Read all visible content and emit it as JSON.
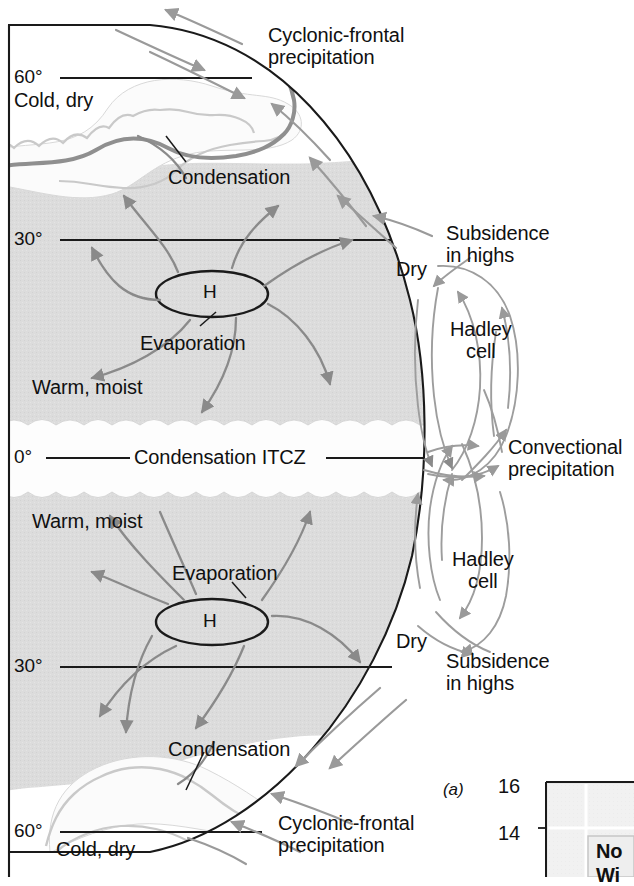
{
  "figure": {
    "kind": "atmospheric-circulation-cross-section"
  },
  "colors": {
    "land_fill": "#dcdcdc",
    "cloud_fill": "#fbfbfb",
    "outline": "#1a1a1a",
    "arrow": "#8a8a8a",
    "front_line": "#8f8f8f",
    "text": "#101010",
    "panel_grid": "#d6d6d6"
  },
  "latitude_labels": [
    {
      "id": "lat-60n",
      "text": "60°",
      "x": 14,
      "y": 66
    },
    {
      "id": "lat-30n",
      "text": "30°",
      "x": 14,
      "y": 228
    },
    {
      "id": "lat-0",
      "text": "0°",
      "x": 14,
      "y": 448
    },
    {
      "id": "lat-30s",
      "text": "30°",
      "x": 14,
      "y": 655
    },
    {
      "id": "lat-60s",
      "text": "60°",
      "x": 14,
      "y": 820
    }
  ],
  "annotations": [
    {
      "id": "cold-dry-north",
      "text": "Cold, dry",
      "x": 14,
      "y": 89,
      "size": "body"
    },
    {
      "id": "cyclonic-north",
      "text": "Cyclonic-frontal\nprecipitation",
      "x": 268,
      "y": 24,
      "size": "body"
    },
    {
      "id": "condensation-north",
      "text": "Condensation",
      "x": 168,
      "y": 166,
      "size": "body"
    },
    {
      "id": "subsidence-north",
      "text": "Subsidence\nin highs",
      "x": 446,
      "y": 222,
      "size": "body"
    },
    {
      "id": "dry-north",
      "text": "Dry",
      "x": 396,
      "y": 258,
      "size": "body"
    },
    {
      "id": "hadley-north",
      "text": "Hadley\ncell",
      "x": 450,
      "y": 318,
      "size": "body"
    },
    {
      "id": "high-north",
      "text": "H",
      "x": 203,
      "y": 281,
      "size": "h"
    },
    {
      "id": "evaporation-north",
      "text": "Evaporation",
      "x": 140,
      "y": 332,
      "size": "body"
    },
    {
      "id": "warm-moist-north",
      "text": "Warm, moist",
      "x": 32,
      "y": 376,
      "size": "body"
    },
    {
      "id": "condensation-itcz",
      "text": "Condensation ITCZ",
      "x": 134,
      "y": 446,
      "size": "body"
    },
    {
      "id": "convectional",
      "text": "Convectional\nprecipitation",
      "x": 508,
      "y": 436,
      "size": "body"
    },
    {
      "id": "warm-moist-south",
      "text": "Warm, moist",
      "x": 32,
      "y": 510,
      "size": "body"
    },
    {
      "id": "evaporation-south",
      "text": "Evaporation",
      "x": 172,
      "y": 562,
      "size": "body"
    },
    {
      "id": "high-south",
      "text": "H",
      "x": 203,
      "y": 610,
      "size": "h"
    },
    {
      "id": "hadley-south",
      "text": "Hadley\ncell",
      "x": 452,
      "y": 548,
      "size": "body"
    },
    {
      "id": "dry-south",
      "text": "Dry",
      "x": 396,
      "y": 630,
      "size": "body"
    },
    {
      "id": "subsidence-south",
      "text": "Subsidence\nin highs",
      "x": 446,
      "y": 650,
      "size": "body"
    },
    {
      "id": "condensation-south",
      "text": "Condensation",
      "x": 168,
      "y": 738,
      "size": "body"
    },
    {
      "id": "cold-dry-south",
      "text": "Cold, dry",
      "x": 56,
      "y": 838,
      "size": "body"
    },
    {
      "id": "cyclonic-south",
      "text": "Cyclonic-frontal\nprecipitation",
      "x": 278,
      "y": 812,
      "size": "body"
    }
  ],
  "inset_panel": {
    "id": "panel-a",
    "part_label": "(a)",
    "axis_ticks": [
      {
        "text": "16",
        "x": 498,
        "y": 775
      },
      {
        "text": "14",
        "x": 498,
        "y": 822
      }
    ],
    "part_label_x": 443,
    "part_label_y": 780,
    "legend_lines": [
      "No",
      "Wi"
    ],
    "note": "chart cropped at image edge"
  }
}
